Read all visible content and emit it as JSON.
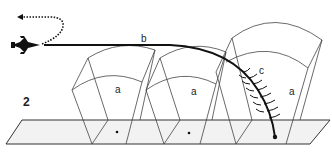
{
  "figure": {
    "number_label": "2",
    "labels": {
      "flight_path": "b",
      "trajectory": "c",
      "coverage_1": "a",
      "coverage_2": "a",
      "coverage_3": "a"
    },
    "colors": {
      "line": "#333333",
      "path": "#111111",
      "ground_fill": "#f2f2f2",
      "background": "#ffffff"
    },
    "icons": {
      "aircraft": "jet-aircraft-icon",
      "return_arrow": "dotted-arrow-icon"
    }
  }
}
